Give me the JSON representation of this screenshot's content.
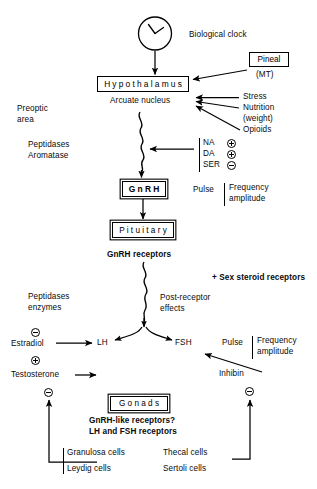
{
  "diagram": {
    "nodes": {
      "clock": "biological-clock-face",
      "biological_clock": "Biological clock",
      "pineal": "Pineal",
      "pineal_sub": "(MT)",
      "hypothalamus": "Hypothalamus",
      "arcuate_nucleus": "Arcuate nucleus",
      "gnrh": "G n R H",
      "pituitary": "P i t u i t a r y",
      "gonads": "G o n a d s"
    },
    "left_labels": {
      "preoptic": "Preoptic",
      "area": "area",
      "peptidases_1": "Peptidases",
      "aromatase": "Aromatase",
      "peptidases_2": "Peptidases",
      "enzymes": "enzymes",
      "estradiol": "Estradiol",
      "testosterone": "Testosterone"
    },
    "inputs": {
      "stress": "Stress",
      "nutrition": "Nutrition",
      "weight": "(weight)",
      "opioids": "Opioids"
    },
    "neurotransmitters": [
      {
        "name": "NA",
        "sign": "+"
      },
      {
        "name": "DA",
        "sign": "+"
      },
      {
        "name": "SER",
        "sign": "−"
      }
    ],
    "pulse_hypothalamic": {
      "label": "Pulse",
      "line1": "Frequency",
      "line2": "amplitude"
    },
    "pulse_gonadotropin": {
      "label": "Pulse",
      "line1": "Frequency",
      "line2": "amplitude"
    },
    "receptors": {
      "gnrh_receptors": "GnRH receptors",
      "sex_steroid": "+ Sex steroid receptors",
      "post_receptor_1": "Post-receptor",
      "post_receptor_2": "effects"
    },
    "gonadotropins": {
      "lh": "LH",
      "fsh": "FSH"
    },
    "feedback": {
      "inhibin": "Inhibin",
      "estradiol_sign": "−",
      "testosterone_sign_pos": "+",
      "testosterone_sign_neg": "−",
      "inhibin_sign": "−"
    },
    "gonad_detail": {
      "line1": "GnRH-like receptors?",
      "line2": "LH and FSH receptors"
    },
    "cells": {
      "granulosa": "Granulosa cells",
      "leydig": "Leydig cells",
      "thecal": "Thecal cells",
      "sertoli": "Sertoli cells"
    },
    "colors": {
      "ink": "#000000",
      "background": "#ffffff"
    }
  }
}
